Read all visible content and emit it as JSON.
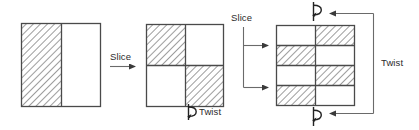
{
  "diagram": {
    "colors": {
      "stroke": "#4a4a4a",
      "stroke_dark": "#333333",
      "hatch": "#8c8c8c",
      "text": "#2b2b2b",
      "background": "#ffffff",
      "fill_white": "#ffffff"
    },
    "labels": {
      "slice_1": "Slice",
      "slice_2": "Slice",
      "twist_1": "Twist",
      "twist_2": "Twist"
    },
    "icons": {
      "slice_arrow": "arrow-right-icon",
      "twist_symbol": "twist-rotation-icon",
      "bracket_arrow": "arrow-left-icon"
    },
    "stages": [
      {
        "name": "stage-1-square",
        "description": "Square split into two vertical halves",
        "columns": 2,
        "rows": 1,
        "cells": [
          {
            "row": 0,
            "col": 0,
            "fill": "hatched"
          },
          {
            "row": 0,
            "col": 1,
            "fill": "white"
          }
        ]
      },
      {
        "name": "stage-2-square",
        "description": "Square split into 2x2 checkerboard",
        "columns": 2,
        "rows": 2,
        "cells": [
          {
            "row": 0,
            "col": 0,
            "fill": "hatched"
          },
          {
            "row": 0,
            "col": 1,
            "fill": "white"
          },
          {
            "row": 1,
            "col": 0,
            "fill": "white"
          },
          {
            "row": 1,
            "col": 1,
            "fill": "hatched"
          }
        ]
      },
      {
        "name": "stage-3-square",
        "description": "Square split into 2 columns by 4 rows, alternating",
        "columns": 2,
        "rows": 4,
        "cells": [
          {
            "row": 0,
            "col": 0,
            "fill": "white"
          },
          {
            "row": 0,
            "col": 1,
            "fill": "hatched"
          },
          {
            "row": 1,
            "col": 0,
            "fill": "hatched"
          },
          {
            "row": 1,
            "col": 1,
            "fill": "white"
          },
          {
            "row": 2,
            "col": 0,
            "fill": "white"
          },
          {
            "row": 2,
            "col": 1,
            "fill": "hatched"
          },
          {
            "row": 3,
            "col": 0,
            "fill": "hatched"
          },
          {
            "row": 3,
            "col": 1,
            "fill": "white"
          }
        ]
      }
    ]
  }
}
